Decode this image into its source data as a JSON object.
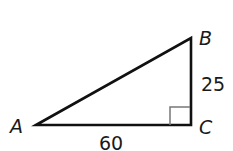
{
  "diagram": {
    "type": "right-triangle",
    "vertices": {
      "A": {
        "label": "A"
      },
      "B": {
        "label": "B"
      },
      "C": {
        "label": "C"
      }
    },
    "sides": {
      "BC": {
        "label": "25"
      },
      "AC": {
        "label": "60"
      }
    },
    "right_angle_at": "C",
    "colors": {
      "stroke": "#111111",
      "right_angle_mark": "#777777"
    }
  }
}
